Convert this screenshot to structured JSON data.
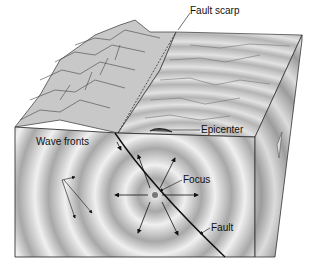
{
  "diagram": {
    "type": "earthquake-block-diagram",
    "labels": {
      "fault_scarp": "Fault scarp",
      "epicenter": "Epicenter",
      "wave_fronts": "Wave fronts",
      "focus": "Focus",
      "fault": "Fault"
    },
    "colors": {
      "background": "#ffffff",
      "ring_light": "#e6e6e6",
      "ring_dark": "#9a9a9a",
      "outline": "#222222",
      "text": "#111111"
    },
    "focus_point": {
      "x": 155,
      "y": 195
    },
    "ring_count": 8
  }
}
